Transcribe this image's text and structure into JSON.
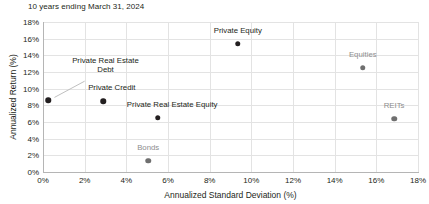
{
  "chart_data": {
    "type": "scatter",
    "title": "10 years ending March 31, 2024",
    "xlabel": "Annualized Standard Deviation (%)",
    "ylabel": "Annualized Return (%)",
    "xlim": [
      0,
      18
    ],
    "ylim": [
      0,
      18
    ],
    "xticks": [
      "0%",
      "2%",
      "4%",
      "6%",
      "8%",
      "10%",
      "12%",
      "14%",
      "16%",
      "18%"
    ],
    "xtick_values": [
      0,
      2,
      4,
      6,
      8,
      10,
      12,
      14,
      16,
      18
    ],
    "yticks": [
      "0%",
      "2%",
      "4%",
      "6%",
      "8%",
      "10%",
      "12%",
      "14%",
      "16%",
      "18%"
    ],
    "ytick_values": [
      0,
      2,
      4,
      6,
      8,
      10,
      12,
      14,
      16,
      18
    ],
    "grid": true,
    "legend": "none",
    "marker_color": "#231f20",
    "muted_color": "#8d8d8d",
    "gridline_color": "#e3e3e3",
    "points": [
      {
        "label": "Private Real Estate Debt",
        "x": 0.25,
        "y": 8.6,
        "label_x": 3.0,
        "label_y": 11.9,
        "style": "dark",
        "lines": [
          "Private Real Estate",
          "Debt"
        ],
        "has_leader": true
      },
      {
        "label": "Private Credit",
        "x": 2.9,
        "y": 8.5,
        "label_x": 3.3,
        "label_y": 9.8,
        "style": "dark",
        "lines": [
          "Private Credit"
        ],
        "has_leader": false
      },
      {
        "label": "Private Real Estate Equity",
        "x": 5.5,
        "y": 6.5,
        "label_x": 6.2,
        "label_y": 7.8,
        "style": "dark",
        "lines": [
          "Private Real Estate Equity"
        ],
        "has_leader": false
      },
      {
        "label": "Private Equity",
        "x": 9.35,
        "y": 15.4,
        "label_x": 9.35,
        "label_y": 16.6,
        "style": "dark",
        "lines": [
          "Private Equity"
        ],
        "has_leader": false
      },
      {
        "label": "Equities",
        "x": 15.35,
        "y": 12.5,
        "label_x": 15.35,
        "label_y": 13.7,
        "style": "muted",
        "lines": [
          "Equities"
        ],
        "has_leader": false
      },
      {
        "label": "REITs",
        "x": 16.85,
        "y": 6.4,
        "label_x": 16.85,
        "label_y": 7.6,
        "style": "muted",
        "lines": [
          "REITs"
        ],
        "has_leader": false
      },
      {
        "label": "Bonds",
        "x": 5.05,
        "y": 1.35,
        "label_x": 5.05,
        "label_y": 2.6,
        "style": "muted",
        "lines": [
          "Bonds"
        ],
        "has_leader": false
      }
    ],
    "leader_line": {
      "from_x": 2.0,
      "from_y": 10.9,
      "to_x": 0.55,
      "to_y": 8.95,
      "color": "#b8b8b8"
    }
  }
}
